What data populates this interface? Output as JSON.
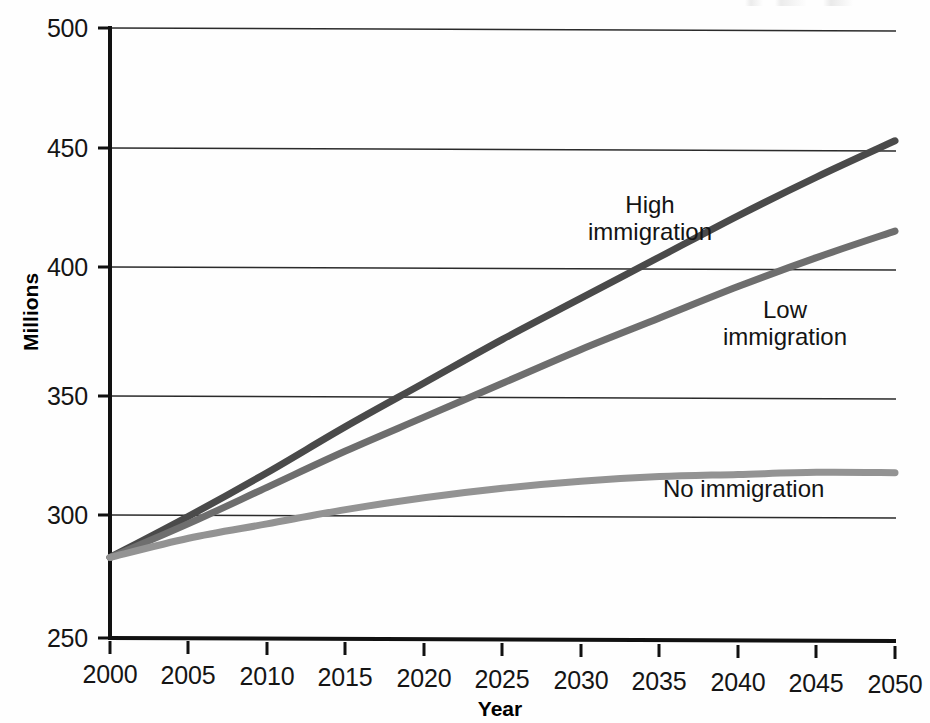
{
  "chart_data": {
    "type": "line",
    "title": "",
    "xlabel": "Year",
    "ylabel": "Millions",
    "xlim": [
      2000,
      2050
    ],
    "ylim": [
      250,
      500
    ],
    "xticks": [
      2000,
      2005,
      2010,
      2015,
      2020,
      2025,
      2030,
      2035,
      2040,
      2045,
      2050
    ],
    "yticks": [
      250,
      300,
      350,
      400,
      450,
      500
    ],
    "grid": "horizontal",
    "legend_position": "inline-annotations",
    "x": [
      2000,
      2005,
      2010,
      2015,
      2020,
      2025,
      2030,
      2035,
      2040,
      2045,
      2050
    ],
    "series": [
      {
        "name": "High immigration",
        "color": "#4a4a4a",
        "values": [
          283,
          300,
          318,
          337,
          355,
          373,
          390,
          407,
          424,
          440,
          455
        ]
      },
      {
        "name": "Low immigration",
        "color": "#6e6e6e",
        "values": [
          283,
          297,
          312,
          327,
          341,
          355,
          369,
          382,
          395,
          407,
          418
        ]
      },
      {
        "name": "No immigration",
        "color": "#939393",
        "values": [
          283,
          291,
          297,
          303,
          308,
          312,
          315,
          317,
          318,
          319,
          319
        ]
      }
    ],
    "annotations": [
      {
        "name": "High immigration",
        "text": "High\nimmigration",
        "x": 2027,
        "y": 425
      },
      {
        "name": "Low immigration",
        "text": "Low\nimmigration",
        "x": 2041,
        "y": 378
      },
      {
        "name": "No immigration",
        "text": "No immigration",
        "x": 2038,
        "y": 306
      }
    ]
  },
  "axes": {
    "y_label": "Millions",
    "x_label": "Year",
    "y_tick_labels": [
      "500",
      "450",
      "400",
      "350",
      "300",
      "250"
    ],
    "x_tick_labels": [
      "2000",
      "2005",
      "2010",
      "2015",
      "2020",
      "2025",
      "2030",
      "2035",
      "2040",
      "2045",
      "2050"
    ]
  },
  "annotations": {
    "high": "High\nimmigration",
    "low": "Low\nimmigration",
    "no": "No immigration"
  },
  "colors": {
    "high_immigration": "#4a4a4a",
    "low_immigration": "#6e6e6e",
    "no_immigration": "#939393",
    "axis": "#111111",
    "gridline": "#2a2a2a",
    "background": "#fefefe"
  }
}
